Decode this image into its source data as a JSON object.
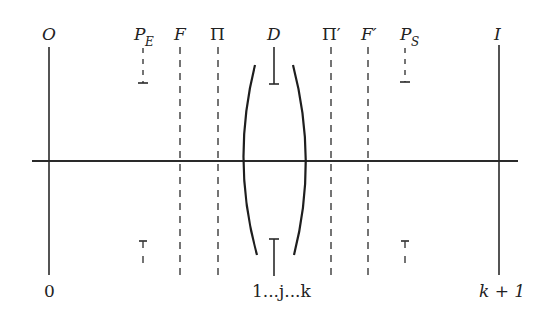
{
  "diagram": {
    "type": "optical-system-schematic",
    "colors": {
      "line": "#2a2a2a",
      "background": "#ffffff"
    },
    "optical_axis": {
      "x1": 32,
      "x2": 518,
      "y": 161
    },
    "planes": [
      {
        "id": "object",
        "label": "O",
        "bottom_label": "0",
        "x": 49,
        "style": "solid"
      },
      {
        "id": "entrance-pupil",
        "label": "P",
        "subscript": "E",
        "x": 143,
        "style": "pupil-stop"
      },
      {
        "id": "front-focal",
        "label": "F",
        "x": 180,
        "style": "dashed"
      },
      {
        "id": "front-principal",
        "label": "Π",
        "x": 218,
        "style": "dashed"
      },
      {
        "id": "diaphragm",
        "label": "D",
        "x": 274,
        "style": "aperture-stop"
      },
      {
        "id": "rear-principal",
        "label": "Π′",
        "x": 331,
        "style": "dashed"
      },
      {
        "id": "rear-focal",
        "label": "F′",
        "x": 368,
        "style": "dashed"
      },
      {
        "id": "exit-pupil",
        "label": "P",
        "subscript": "S",
        "x": 405,
        "style": "pupil-stop"
      },
      {
        "id": "image",
        "label": "I",
        "bottom_label": "k + 1",
        "x": 499,
        "style": "solid"
      }
    ],
    "lens": {
      "surfaces_label": "1...j...k"
    },
    "labels": {
      "O": "O",
      "PE_main": "P",
      "PE_sub": "E",
      "F": "F",
      "Pi": "Π",
      "D": "D",
      "Pi_prime": "Π′",
      "F_prime": "F′",
      "PS_main": "P",
      "PS_sub": "S",
      "I": "I",
      "zero": "0",
      "surfaces": "1...j...k",
      "k_plus_1": "k + 1"
    }
  }
}
